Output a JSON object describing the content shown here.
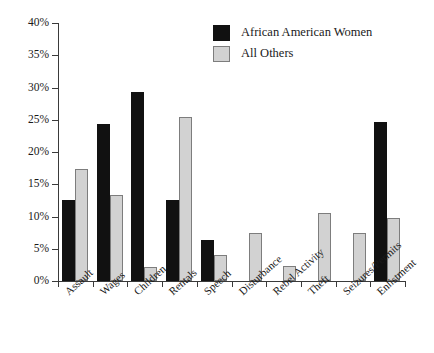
{
  "chart_data": {
    "type": "bar",
    "title": "",
    "xlabel": "",
    "ylabel": "",
    "ylim": [
      0,
      40
    ],
    "grid": false,
    "legend_position": "top-center",
    "ytick_labels": [
      "0%",
      "5%",
      "10%",
      "15%",
      "20%",
      "25%",
      "30%",
      "35%",
      "40%"
    ],
    "ytick_values": [
      0,
      5,
      10,
      15,
      20,
      25,
      30,
      35,
      40
    ],
    "categories": [
      "Assault",
      "Wages",
      "Children",
      "Rentals",
      "Speech",
      "Disturbance",
      "Rebel Activity",
      "Theft",
      "Seizures/Permits",
      "Enlistment"
    ],
    "series": [
      {
        "name": "African American Women",
        "color": "#111111",
        "values": [
          12.5,
          24.3,
          29.3,
          12.5,
          6.3,
          0,
          0,
          0,
          0,
          24.6
        ]
      },
      {
        "name": "All Others",
        "color": "#d2d2d2",
        "values": [
          17.3,
          13.3,
          2.2,
          25.4,
          4.0,
          7.4,
          2.4,
          10.6,
          7.4,
          9.7
        ]
      }
    ]
  },
  "legend": {
    "items": [
      {
        "label": "African American Women",
        "swatch": "black"
      },
      {
        "label": "All Others",
        "swatch": "gray"
      }
    ]
  }
}
